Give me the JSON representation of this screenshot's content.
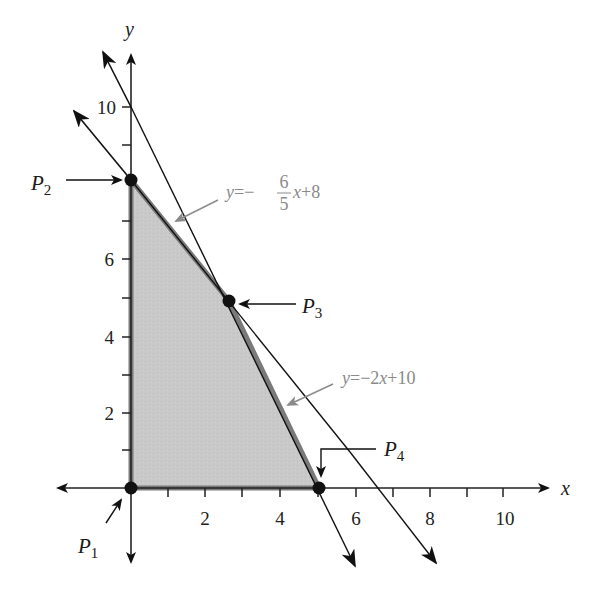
{
  "figure": {
    "axes": {
      "x_label": "x",
      "y_label": "y",
      "x_ticks": [
        {
          "value": 2,
          "label": "2"
        },
        {
          "value": 4,
          "label": "4"
        },
        {
          "value": 6,
          "label": "6"
        },
        {
          "value": 8,
          "label": "8"
        },
        {
          "value": 10,
          "label": "10"
        }
      ],
      "y_ticks": [
        {
          "value": 2,
          "label": "2"
        },
        {
          "value": 4,
          "label": "4"
        },
        {
          "value": 6,
          "label": "6"
        },
        {
          "value": 10,
          "label": "10"
        }
      ]
    },
    "lines": [
      {
        "id": "line1",
        "equation": "y = -6/5 x + 8",
        "label_y": "y",
        "label_eq": "=−",
        "label_num": "6",
        "label_den": "5",
        "label_x": "x",
        "label_rest": "+8"
      },
      {
        "id": "line2",
        "equation": "y = -2x + 10",
        "label_y": "y",
        "label_eq": "=−2",
        "label_x": "x",
        "label_rest": "+10"
      }
    ],
    "points": [
      {
        "name": "P",
        "sub": "1",
        "x": 0,
        "y": 0
      },
      {
        "name": "P",
        "sub": "2",
        "x": 0,
        "y": 8
      },
      {
        "name": "P",
        "sub": "3",
        "x": 2.5,
        "y": 5
      },
      {
        "name": "P",
        "sub": "4",
        "x": 5,
        "y": 0
      }
    ],
    "colors": {
      "region_fill": "#c8c8c8",
      "region_border": "#7a7a7a",
      "axis": "#222222",
      "label_gray": "#8a8a8a",
      "point": "#111111"
    }
  }
}
